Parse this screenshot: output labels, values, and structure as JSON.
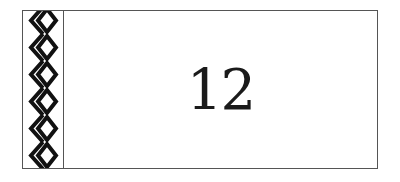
{
  "card": {
    "number": "12",
    "border_color": "#555555",
    "pattern": "diamond-chevron-border-icon"
  }
}
